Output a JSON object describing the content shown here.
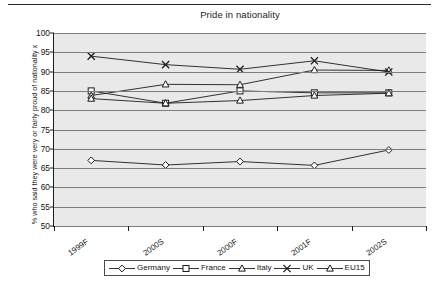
{
  "chart_data": {
    "type": "line",
    "title": "Pride in nationality",
    "xlabel": "",
    "ylabel": "% who said they were very or fairly proud of nationality x",
    "categories": [
      "1999F",
      "2000S",
      "2000F",
      "2001F",
      "2002S"
    ],
    "ylim": [
      50,
      100
    ],
    "yticks": [
      50,
      55,
      60,
      65,
      70,
      75,
      80,
      85,
      90,
      95,
      100
    ],
    "ytick_labels": [
      "50",
      "55",
      "60",
      "65",
      "70",
      "75",
      "80",
      "85",
      "90",
      "95",
      "100"
    ],
    "grid": true,
    "legend_position": "bottom",
    "series": [
      {
        "name": "Germany",
        "marker": "diamond",
        "values": [
          67.0,
          65.8,
          66.7,
          65.7,
          69.7
        ]
      },
      {
        "name": "France",
        "marker": "square",
        "values": [
          85.0,
          81.8,
          85.0,
          84.5,
          84.5
        ]
      },
      {
        "name": "Italy",
        "marker": "triangle",
        "values": [
          83.8,
          86.7,
          86.6,
          90.4,
          90.3
        ]
      },
      {
        "name": "UK",
        "marker": "cross",
        "values": [
          94.0,
          91.8,
          90.6,
          92.8,
          89.9
        ]
      },
      {
        "name": "EU15",
        "marker": "triangle",
        "values": [
          83.0,
          81.8,
          82.5,
          83.8,
          84.4
        ]
      }
    ]
  },
  "colors": {
    "plot_background": "#e9e9e9",
    "gridline": "#7d7d7d",
    "axis": "#1c1c1c",
    "series": "#1c1c1c",
    "text": "#141414"
  }
}
